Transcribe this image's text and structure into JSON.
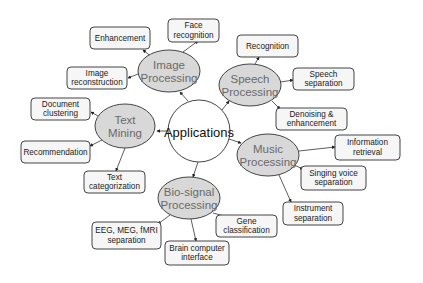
{
  "diagram": {
    "center": {
      "label": "Applications",
      "cx": 199,
      "cy": 131,
      "r": 31
    },
    "categories": [
      {
        "id": "image",
        "lines": [
          "Image",
          "Processing"
        ],
        "cx": 169,
        "cy": 71,
        "rx": 31,
        "ry": 21
      },
      {
        "id": "speech",
        "lines": [
          "Speech",
          "Processing"
        ],
        "cx": 250,
        "cy": 85,
        "rx": 31,
        "ry": 21
      },
      {
        "id": "music",
        "lines": [
          "Music",
          "Processing"
        ],
        "cx": 268,
        "cy": 155,
        "rx": 31,
        "ry": 21
      },
      {
        "id": "biosignal",
        "lines": [
          "Bio-signal",
          "Processing"
        ],
        "cx": 189,
        "cy": 198,
        "rx": 31,
        "ry": 21
      },
      {
        "id": "text",
        "lines": [
          "Text",
          "Mining"
        ],
        "cx": 125,
        "cy": 126,
        "rx": 30,
        "ry": 22
      }
    ],
    "leaves": [
      {
        "id": "enhancement",
        "parent": "image",
        "lines": [
          "Enhancement"
        ],
        "x": 90,
        "y": 27,
        "w": 60,
        "h": 22
      },
      {
        "id": "face-recognition",
        "parent": "image",
        "lines": [
          "Face",
          "recognition"
        ],
        "x": 168,
        "y": 19,
        "w": 51,
        "h": 23
      },
      {
        "id": "image-reconstruction",
        "parent": "image",
        "lines": [
          "Image",
          "reconstruction"
        ],
        "x": 67,
        "y": 67,
        "w": 60,
        "h": 22
      },
      {
        "id": "recognition",
        "parent": "speech",
        "lines": [
          "Recognition"
        ],
        "x": 237,
        "y": 35,
        "w": 61,
        "h": 22
      },
      {
        "id": "speech-separation",
        "parent": "speech",
        "lines": [
          "Speech",
          "separation"
        ],
        "x": 293,
        "y": 68,
        "w": 61,
        "h": 22
      },
      {
        "id": "denoising",
        "parent": "speech",
        "lines": [
          "Denoising &",
          "enhancement"
        ],
        "x": 276,
        "y": 108,
        "w": 71,
        "h": 22
      },
      {
        "id": "information-retrieval",
        "parent": "music",
        "lines": [
          "Information",
          "retrieval"
        ],
        "x": 335,
        "y": 135,
        "w": 65,
        "h": 25
      },
      {
        "id": "singing-voice",
        "parent": "music",
        "lines": [
          "Singing voice",
          "separation"
        ],
        "x": 301,
        "y": 166,
        "w": 65,
        "h": 24
      },
      {
        "id": "instrument-separation",
        "parent": "music",
        "lines": [
          "Instrument",
          "separation"
        ],
        "x": 283,
        "y": 202,
        "w": 60,
        "h": 23
      },
      {
        "id": "gene-classification",
        "parent": "biosignal",
        "lines": [
          "Gene",
          "classification"
        ],
        "x": 216,
        "y": 215,
        "w": 61,
        "h": 22
      },
      {
        "id": "brain-computer",
        "parent": "biosignal",
        "lines": [
          "Brain computer",
          "interface"
        ],
        "x": 165,
        "y": 241,
        "w": 64,
        "h": 24
      },
      {
        "id": "eeg",
        "parent": "biosignal",
        "lines": [
          "EEG, MEG, fMRI",
          "separation"
        ],
        "x": 92,
        "y": 222,
        "w": 69,
        "h": 27
      },
      {
        "id": "document-clustering",
        "parent": "text",
        "lines": [
          "Document",
          "clustering"
        ],
        "x": 31,
        "y": 98,
        "w": 59,
        "h": 22
      },
      {
        "id": "recommendation",
        "parent": "text",
        "lines": [
          "Recommendation"
        ],
        "x": 21,
        "y": 141,
        "w": 69,
        "h": 22
      },
      {
        "id": "text-categorization",
        "parent": "text",
        "lines": [
          "Text",
          "categorization"
        ],
        "x": 84,
        "y": 171,
        "w": 61,
        "h": 22
      }
    ],
    "edges": [
      {
        "from": [
          188,
          101
        ],
        "to": [
          180,
          92
        ]
      },
      {
        "from": [
          222,
          110
        ],
        "to": [
          229,
          101
        ]
      },
      {
        "from": [
          229,
          139
        ],
        "to": [
          241,
          143
        ]
      },
      {
        "from": [
          198,
          162
        ],
        "to": [
          193,
          177
        ]
      },
      {
        "from": [
          168,
          131
        ],
        "to": [
          157,
          131
        ]
      },
      {
        "from": [
          153,
          58
        ],
        "to": [
          143,
          50
        ]
      },
      {
        "from": [
          183,
          52
        ],
        "to": [
          198,
          41
        ]
      },
      {
        "from": [
          138,
          74
        ],
        "to": [
          128,
          78
        ]
      },
      {
        "from": [
          255,
          64
        ],
        "to": [
          259,
          57
        ]
      },
      {
        "from": [
          281,
          82
        ],
        "to": [
          293,
          80
        ]
      },
      {
        "from": [
          272,
          101
        ],
        "to": [
          280,
          109
        ]
      },
      {
        "from": [
          299,
          151
        ],
        "to": [
          335,
          147
        ]
      },
      {
        "from": [
          294,
          165
        ],
        "to": [
          303,
          169
        ]
      },
      {
        "from": [
          279,
          175
        ],
        "to": [
          291,
          202
        ]
      },
      {
        "from": [
          213,
          213
        ],
        "to": [
          228,
          217
        ]
      },
      {
        "from": [
          191,
          219
        ],
        "to": [
          196,
          241
        ]
      },
      {
        "from": [
          170,
          215
        ],
        "to": [
          158,
          224
        ]
      },
      {
        "from": [
          98,
          116
        ],
        "to": [
          91,
          112
        ]
      },
      {
        "from": [
          102,
          140
        ],
        "to": [
          90,
          146
        ]
      },
      {
        "from": [
          125,
          148
        ],
        "to": [
          116,
          171
        ]
      }
    ]
  }
}
